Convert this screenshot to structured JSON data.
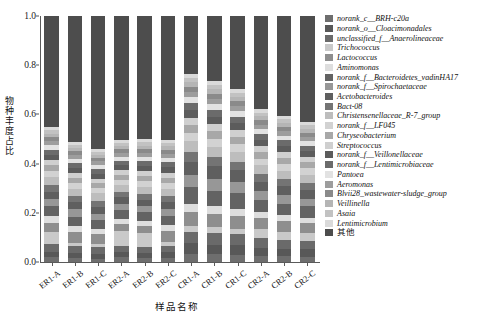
{
  "chart_data": {
    "type": "bar",
    "title": "",
    "subtitle": "",
    "stacked": true,
    "normalized": true,
    "xlabel": "样品名称",
    "ylabel": "物种丰度占比",
    "ylim": [
      0.0,
      1.0
    ],
    "ytick_labels": [
      "0.0",
      "0.2",
      "0.4",
      "0.6",
      "0.8",
      "1.0"
    ],
    "ytick_values": [
      0.0,
      0.2,
      0.4,
      0.6,
      0.8,
      1.0
    ],
    "grid": false,
    "legend_position": "right",
    "categories": [
      "ER1-A",
      "ER1-B",
      "ER1-C",
      "ER2-A",
      "ER2-B",
      "ER2-C",
      "CR1-A",
      "CR1-B",
      "CR1-C",
      "CR2-A",
      "CR2-B",
      "CR2-C"
    ],
    "series": [
      {
        "name": "norank_c__BRH-c20a",
        "color": "#6e6e6e",
        "values": [
          0.018,
          0.016,
          0.014,
          0.021,
          0.015,
          0.017,
          0.03,
          0.028,
          0.026,
          0.024,
          0.022,
          0.02
        ]
      },
      {
        "name": "norank_o__Cloacimonadales",
        "color": "#585858",
        "values": [
          0.022,
          0.02,
          0.019,
          0.018,
          0.02,
          0.021,
          0.038,
          0.034,
          0.036,
          0.03,
          0.028,
          0.027
        ]
      },
      {
        "name": "unclassified_f__Anaerolineaceae",
        "color": "#6a6a6a",
        "values": [
          0.03,
          0.028,
          0.027,
          0.024,
          0.026,
          0.025,
          0.042,
          0.044,
          0.04,
          0.036,
          0.034,
          0.033
        ]
      },
      {
        "name": "Trichococcus",
        "color": "#c9c9c9",
        "values": [
          0.05,
          0.014,
          0.012,
          0.06,
          0.055,
          0.016,
          0.022,
          0.02,
          0.018,
          0.034,
          0.03,
          0.028
        ]
      },
      {
        "name": "Lactococcus",
        "color": "#8e8e8e",
        "values": [
          0.034,
          0.044,
          0.04,
          0.03,
          0.028,
          0.046,
          0.052,
          0.048,
          0.05,
          0.04,
          0.038,
          0.036
        ]
      },
      {
        "name": "Aminomonas",
        "color": "#dedede",
        "values": [
          0.026,
          0.024,
          0.022,
          0.02,
          0.021,
          0.023,
          0.03,
          0.028,
          0.026,
          0.024,
          0.023,
          0.022
        ]
      },
      {
        "name": "norank_f__Bacteroidetes_vadinHA17",
        "color": "#636363",
        "values": [
          0.04,
          0.038,
          0.036,
          0.034,
          0.033,
          0.035,
          0.06,
          0.058,
          0.056,
          0.046,
          0.044,
          0.042
        ]
      },
      {
        "name": "norank_f__Spirochaetaceae",
        "color": "#979797",
        "values": [
          0.028,
          0.03,
          0.027,
          0.025,
          0.026,
          0.028,
          0.044,
          0.042,
          0.04,
          0.032,
          0.03,
          0.029
        ]
      },
      {
        "name": "Acetobacteroides",
        "color": "#5f5f5f",
        "values": [
          0.03,
          0.029,
          0.028,
          0.026,
          0.025,
          0.027,
          0.048,
          0.046,
          0.044,
          0.036,
          0.034,
          0.032
        ]
      },
      {
        "name": "Bact-08",
        "color": "#747474",
        "values": [
          0.026,
          0.025,
          0.024,
          0.022,
          0.023,
          0.024,
          0.036,
          0.034,
          0.032,
          0.028,
          0.027,
          0.026
        ]
      },
      {
        "name": "Christensenellaceae_R-7_group",
        "color": "#bdbdbd",
        "values": [
          0.032,
          0.031,
          0.03,
          0.028,
          0.029,
          0.03,
          0.04,
          0.038,
          0.036,
          0.033,
          0.032,
          0.031
        ]
      },
      {
        "name": "norank_f__LF045",
        "color": "#d2d2d2",
        "values": [
          0.024,
          0.023,
          0.022,
          0.021,
          0.022,
          0.023,
          0.03,
          0.029,
          0.028,
          0.026,
          0.025,
          0.024
        ]
      },
      {
        "name": "Chryseobacterium",
        "color": "#a8a8a8",
        "values": [
          0.022,
          0.021,
          0.02,
          0.019,
          0.02,
          0.021,
          0.028,
          0.027,
          0.026,
          0.024,
          0.023,
          0.022
        ]
      },
      {
        "name": "Streptococcus",
        "color": "#cfcfcf",
        "values": [
          0.02,
          0.019,
          0.018,
          0.018,
          0.019,
          0.02,
          0.026,
          0.025,
          0.024,
          0.022,
          0.021,
          0.02
        ]
      },
      {
        "name": "norank_f__Veillonellaceae",
        "color": "#5c5c5c",
        "values": [
          0.022,
          0.021,
          0.02,
          0.02,
          0.021,
          0.022,
          0.03,
          0.028,
          0.027,
          0.024,
          0.023,
          0.022
        ]
      },
      {
        "name": "norank_f__Lentimicrobiaceae",
        "color": "#6b6b6b",
        "values": [
          0.02,
          0.019,
          0.019,
          0.018,
          0.019,
          0.02,
          0.026,
          0.025,
          0.024,
          0.022,
          0.021,
          0.02
        ]
      },
      {
        "name": "Pantoea",
        "color": "#e2e2e2",
        "values": [
          0.018,
          0.017,
          0.017,
          0.016,
          0.017,
          0.018,
          0.022,
          0.021,
          0.02,
          0.019,
          0.018,
          0.018
        ]
      },
      {
        "name": "Aeromonas",
        "color": "#9d9d9d",
        "values": [
          0.016,
          0.016,
          0.015,
          0.015,
          0.016,
          0.016,
          0.02,
          0.019,
          0.019,
          0.017,
          0.017,
          0.016
        ]
      },
      {
        "name": "Blvii28_wastewater-sludge_group",
        "color": "#8a8a8a",
        "values": [
          0.015,
          0.015,
          0.014,
          0.014,
          0.015,
          0.015,
          0.018,
          0.018,
          0.017,
          0.016,
          0.016,
          0.015
        ]
      },
      {
        "name": "Veillinella",
        "color": "#b5b5b5",
        "values": [
          0.014,
          0.014,
          0.013,
          0.013,
          0.014,
          0.014,
          0.017,
          0.017,
          0.016,
          0.015,
          0.015,
          0.014
        ]
      },
      {
        "name": "Asaia",
        "color": "#c2c2c2",
        "values": [
          0.013,
          0.013,
          0.012,
          0.012,
          0.013,
          0.013,
          0.016,
          0.015,
          0.015,
          0.014,
          0.014,
          0.013
        ]
      },
      {
        "name": "Lentimicrobium",
        "color": "#dadada",
        "values": [
          0.012,
          0.012,
          0.011,
          0.011,
          0.012,
          0.012,
          0.015,
          0.014,
          0.014,
          0.013,
          0.013,
          0.012
        ]
      },
      {
        "name": "其他",
        "color": "#4d4d4d",
        "values": [
          0.438,
          0.511,
          0.54,
          0.495,
          0.491,
          0.494,
          0.21,
          0.236,
          0.266,
          0.349,
          0.372,
          0.396
        ]
      }
    ]
  },
  "axis": {
    "y_title": "物种丰度占比",
    "x_title": "样品名称"
  },
  "legend": {
    "items": [
      {
        "label": "norank_c__BRH-c20a",
        "color": "#6e6e6e",
        "cjk": false
      },
      {
        "label": "norank_o__Cloacimonadales",
        "color": "#585858",
        "cjk": false
      },
      {
        "label": "unclassified_f__Anaerolineaceae",
        "color": "#6a6a6a",
        "cjk": false
      },
      {
        "label": "Trichococcus",
        "color": "#c9c9c9",
        "cjk": false
      },
      {
        "label": "Lactococcus",
        "color": "#8e8e8e",
        "cjk": false
      },
      {
        "label": "Aminomonas",
        "color": "#dedede",
        "cjk": false
      },
      {
        "label": "norank_f__Bacteroidetes_vadinHA17",
        "color": "#636363",
        "cjk": false
      },
      {
        "label": "norank_f__Spirochaetaceae",
        "color": "#979797",
        "cjk": false
      },
      {
        "label": "Acetobacteroides",
        "color": "#5f5f5f",
        "cjk": false
      },
      {
        "label": "Bact-08",
        "color": "#747474",
        "cjk": false
      },
      {
        "label": "Christensenellaceae_R-7_group",
        "color": "#bdbdbd",
        "cjk": false
      },
      {
        "label": "norank_f__LF045",
        "color": "#d2d2d2",
        "cjk": false
      },
      {
        "label": "Chryseobacterium",
        "color": "#a8a8a8",
        "cjk": false
      },
      {
        "label": "Streptococcus",
        "color": "#cfcfcf",
        "cjk": false
      },
      {
        "label": "norank_f__Veillonellaceae",
        "color": "#5c5c5c",
        "cjk": false
      },
      {
        "label": "norank_f__Lentimicrobiaceae",
        "color": "#6b6b6b",
        "cjk": false
      },
      {
        "label": "Pantoea",
        "color": "#e2e2e2",
        "cjk": false
      },
      {
        "label": "Aeromonas",
        "color": "#9d9d9d",
        "cjk": false
      },
      {
        "label": "Blvii28_wastewater-sludge_group",
        "color": "#8a8a8a",
        "cjk": false
      },
      {
        "label": "Veillinella",
        "color": "#b5b5b5",
        "cjk": false
      },
      {
        "label": "Asaia",
        "color": "#c2c2c2",
        "cjk": false
      },
      {
        "label": "Lentimicrobium",
        "color": "#dadada",
        "cjk": false
      },
      {
        "label": "其他",
        "color": "#4d4d4d",
        "cjk": true
      }
    ]
  }
}
